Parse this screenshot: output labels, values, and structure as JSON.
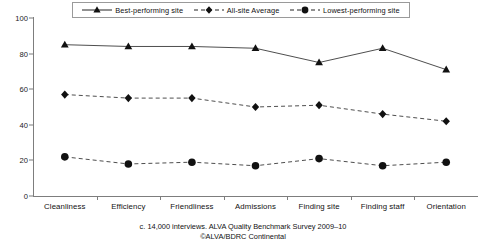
{
  "chart_data": {
    "type": "line",
    "title": "",
    "xlabel": "",
    "ylabel": "",
    "ylim": [
      0,
      100
    ],
    "yticks": [
      0,
      20,
      40,
      60,
      80,
      100
    ],
    "grid": false,
    "legend_position": "top",
    "categories": [
      "Cleanliness",
      "Efficiency",
      "Friendliness",
      "Admissions",
      "Finding site",
      "Finding staff",
      "Orientation"
    ],
    "series": [
      {
        "name": "Best-performing site",
        "marker": "triangle",
        "linestyle": "solid",
        "values": [
          85,
          84,
          84,
          83,
          75,
          83,
          71
        ]
      },
      {
        "name": "All-site Average",
        "marker": "diamond",
        "linestyle": "dashed",
        "values": [
          57,
          55,
          55,
          50,
          51,
          46,
          42
        ]
      },
      {
        "name": "Lowest-performing site",
        "marker": "circle",
        "linestyle": "dashed",
        "values": [
          22,
          18,
          19,
          17,
          21,
          17,
          19
        ]
      }
    ]
  },
  "caption": {
    "line1": "c. 14,000 interviews. ALVA Quality Benchmark Survey 2009–10",
    "line2": "©ALVA/BDRC Continental"
  },
  "colors": {
    "ink": "#111111",
    "axis": "#7d7d7d",
    "line": "#3a3a3a",
    "background": "#ffffff"
  }
}
